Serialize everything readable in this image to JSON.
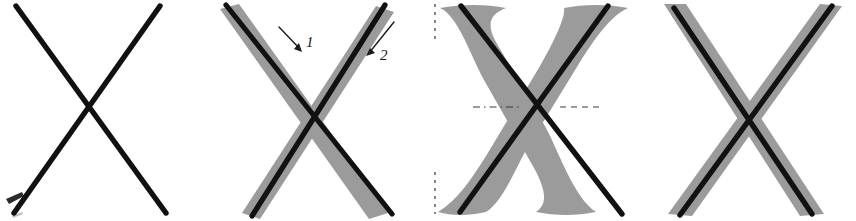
{
  "figure": {
    "title": "X letterform stroke-fitting stages",
    "background_color": "#ffffff",
    "width": 856,
    "height": 221,
    "panel_count": 4,
    "ink_color": "#111111",
    "gray_color": "#9b9b9b",
    "guide_color": "#3a3a3a"
  },
  "panels": [
    {
      "id": "panel-1",
      "index": "1",
      "caption": "",
      "description": "two plain black straight strokes forming an X",
      "has_gray_glyph": false,
      "has_annotations": false,
      "has_guides": false
    },
    {
      "id": "panel-2",
      "index": "2",
      "caption": "",
      "description": "black straight strokes overlaid on thick gray brush strokes, with two numbered arrows",
      "has_gray_glyph": true,
      "has_annotations": true,
      "has_guides": false
    },
    {
      "id": "panel-3",
      "index": "3",
      "caption": "",
      "description": "black straight strokes overlaid on a gray serif X glyph with dashed alignment guides",
      "has_gray_glyph": true,
      "has_annotations": false,
      "has_guides": true
    },
    {
      "id": "panel-4",
      "index": "4",
      "caption": "",
      "description": "black straight strokes centered within thick gray brush strokes",
      "has_gray_glyph": true,
      "has_annotations": false,
      "has_guides": false
    }
  ],
  "annotations": [
    {
      "id": "arrow-1",
      "label": "1",
      "points_to": "down-right",
      "target": "first stroke"
    },
    {
      "id": "arrow-2",
      "label": "2",
      "points_to": "down-left",
      "target": "second stroke"
    }
  ],
  "guides": [
    {
      "id": "guide-top-left",
      "orientation": "vertical",
      "style": "dashed"
    },
    {
      "id": "guide-bottom-left",
      "orientation": "vertical",
      "style": "dashed"
    },
    {
      "id": "guide-mid-left",
      "orientation": "horizontal",
      "style": "dash-dot"
    },
    {
      "id": "guide-mid-right",
      "orientation": "horizontal",
      "style": "dashed"
    }
  ],
  "corner_mark": {
    "id": "bottom-left-mark",
    "text": ""
  }
}
